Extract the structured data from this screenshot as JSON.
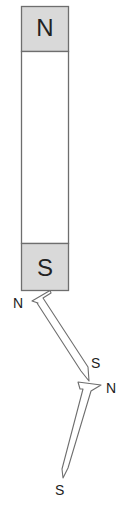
{
  "magnet": {
    "north_label": "N",
    "south_label": "S",
    "cap_color": "#d9d9d9",
    "body_color": "#ffffff",
    "outline_color": "#6e6e6e"
  },
  "nail_upper": {
    "head_label": "N",
    "tip_label": "S"
  },
  "nail_lower": {
    "head_label": "N",
    "tip_label": "S"
  }
}
